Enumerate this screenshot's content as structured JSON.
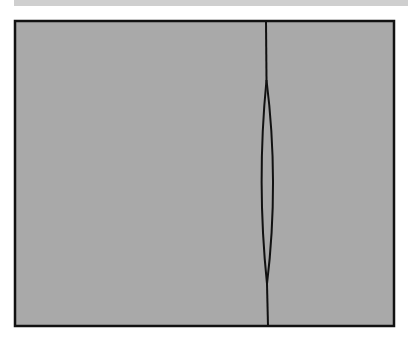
{
  "figure": {
    "colors": {
      "background": "#ffffff",
      "panel_fill": "#a9a9a9",
      "top_band": "#cfcfcf",
      "stroke": "#111111"
    },
    "panel": {
      "x": 15,
      "y": 21,
      "width": 379,
      "height": 305,
      "stroke_width": 2.5
    },
    "divider": {
      "top_x": 266,
      "bottom_x": 268,
      "lens_top_y": 80,
      "lens_bottom_y": 284,
      "lens_left_x": 261,
      "lens_right_x": 273
    }
  }
}
